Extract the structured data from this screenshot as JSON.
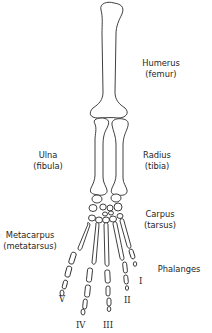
{
  "diagram": {
    "stroke_color": "#2a2a2a",
    "background_color": "#ffffff",
    "labels": {
      "humerus": {
        "name": "Humerus",
        "alt": "(femur)"
      },
      "ulna": {
        "name": "Ulna",
        "alt": "(fibula)"
      },
      "radius": {
        "name": "Radius",
        "alt": "(tibia)"
      },
      "carpus": {
        "name": "Carpus",
        "alt": "(tarsus)"
      },
      "metacarpus": {
        "name": "Metacarpus",
        "alt": "(metatarsus)"
      },
      "phalanges": {
        "name": "Phalanges"
      }
    },
    "digits": [
      {
        "numeral": "I"
      },
      {
        "numeral": "II"
      },
      {
        "numeral": "III"
      },
      {
        "numeral": "IV"
      },
      {
        "numeral": "V"
      }
    ]
  }
}
